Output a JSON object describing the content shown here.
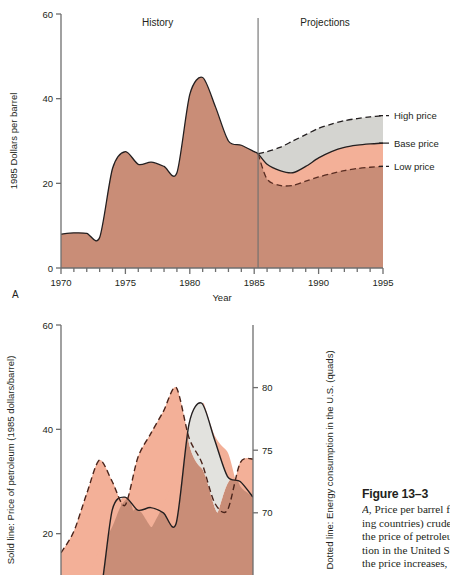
{
  "figure": {
    "caption_title": "Figure 13–3",
    "caption_lines": [
      "A, Price per barrel for OPEC (oil export-",
      "ing countries) crude oil. B, Comparison of",
      "the price of petroleum and energy consump-",
      "tion in the United States. Note that when",
      "the price increases, consumption decreases."
    ],
    "caption_italic_lead": "A,"
  },
  "panel_a": {
    "letter": "A",
    "annotations": [
      "History",
      "Projections"
    ],
    "divider_year": 1985,
    "legend": [
      "High price",
      "Base price",
      "Low price"
    ],
    "colors": {
      "base_fill": "#c98d77",
      "low_band_fill": "#f3b098",
      "high_band_fill": "#d4d4d0",
      "line": "#231f20",
      "axis": "#6e6e6e"
    }
  },
  "panel_b": {
    "letter": "B",
    "colors": {
      "overlap_fill": "#c98d77",
      "consumption_above_fill": "#f3b098",
      "price_above_fill": "#e2e2de",
      "line": "#231f20",
      "axis": "#6e6e6e"
    }
  },
  "chart_data": [
    {
      "type": "area",
      "id": "panel-a",
      "title": "",
      "xlabel": "Year",
      "ylabel": "1985 Dollars per barrel",
      "xlim": [
        1970,
        1995
      ],
      "ylim": [
        0,
        60
      ],
      "xticks": [
        1970,
        1975,
        1980,
        1985,
        1990,
        1995
      ],
      "yticks": [
        0,
        20,
        40,
        60
      ],
      "minor_xtick_step": 1,
      "grid": false,
      "legend_position": "right",
      "annotations": [
        {
          "text": "History",
          "x": 1977.5,
          "y": 58
        },
        {
          "text": "Projections",
          "x": 1990.5,
          "y": 58
        }
      ],
      "vline": 1985.3,
      "series": [
        {
          "name": "Base price",
          "style": "solid",
          "x": [
            1970,
            1971,
            1972,
            1973,
            1974,
            1975,
            1976,
            1977,
            1978,
            1979,
            1980,
            1981,
            1982,
            1983,
            1984,
            1985,
            1985.3,
            1986,
            1987,
            1988,
            1989,
            1990,
            1991,
            1992,
            1993,
            1994,
            1995
          ],
          "values": [
            8.0,
            8.3,
            8.2,
            7.2,
            23.5,
            27.5,
            24.5,
            25.0,
            24.0,
            22.5,
            41.0,
            45.0,
            38.0,
            30.0,
            29.0,
            27.5,
            27.0,
            24.5,
            23.0,
            22.5,
            24.0,
            26.0,
            27.5,
            28.5,
            29.0,
            29.3,
            29.5
          ]
        },
        {
          "name": "High price",
          "style": "dashed",
          "x": [
            1985.3,
            1986,
            1987,
            1988,
            1989,
            1990,
            1991,
            1992,
            1993,
            1994,
            1995
          ],
          "values": [
            27.0,
            27.5,
            28.5,
            30.0,
            31.5,
            33.0,
            34.0,
            34.8,
            35.3,
            35.7,
            36.0
          ]
        },
        {
          "name": "Low price",
          "style": "dashed",
          "x": [
            1985.3,
            1986,
            1987,
            1988,
            1989,
            1990,
            1991,
            1992,
            1993,
            1994,
            1995
          ],
          "values": [
            27.0,
            21.0,
            19.5,
            19.5,
            20.5,
            21.5,
            22.3,
            23.0,
            23.5,
            23.8,
            24.0
          ]
        }
      ]
    },
    {
      "type": "area",
      "id": "panel-b",
      "title": "",
      "xlabel": "Year",
      "ylabel_left": "Solid line: Price of petroleum (1985 dollars/barrel)",
      "ylabel_right": "Dotted line: Energy consumption in the U.S. (quads)",
      "xlim": [
        1970,
        1985
      ],
      "ylim_left": [
        0,
        60
      ],
      "ylim_right": [
        60,
        85
      ],
      "yticks_left": [
        20,
        40,
        60
      ],
      "yticks_right": [
        65,
        70,
        75,
        80
      ],
      "grid": false,
      "series": [
        {
          "name": "Price of petroleum",
          "style": "solid",
          "x": [
            1970,
            1971,
            1972,
            1973,
            1974,
            1975,
            1976,
            1977,
            1978,
            1979,
            1980,
            1981,
            1982,
            1983,
            1984,
            1985
          ],
          "values": [
            8.0,
            9.0,
            9.0,
            7.5,
            24.5,
            27.0,
            24.5,
            25.0,
            24.0,
            22.0,
            41.0,
            45.0,
            38.0,
            31.0,
            30.0,
            27.0
          ]
        },
        {
          "name": "Energy consumption in the U.S.",
          "style": "dashed",
          "x": [
            1970,
            1971,
            1972,
            1973,
            1974,
            1975,
            1976,
            1977,
            1978,
            1979,
            1980,
            1981,
            1982,
            1983,
            1984,
            1985
          ],
          "values": [
            66.8,
            68.5,
            71.5,
            74.2,
            72.5,
            70.6,
            74.4,
            76.3,
            78.1,
            80.0,
            76.0,
            74.0,
            70.8,
            70.2,
            74.0,
            74.3
          ]
        }
      ]
    }
  ]
}
